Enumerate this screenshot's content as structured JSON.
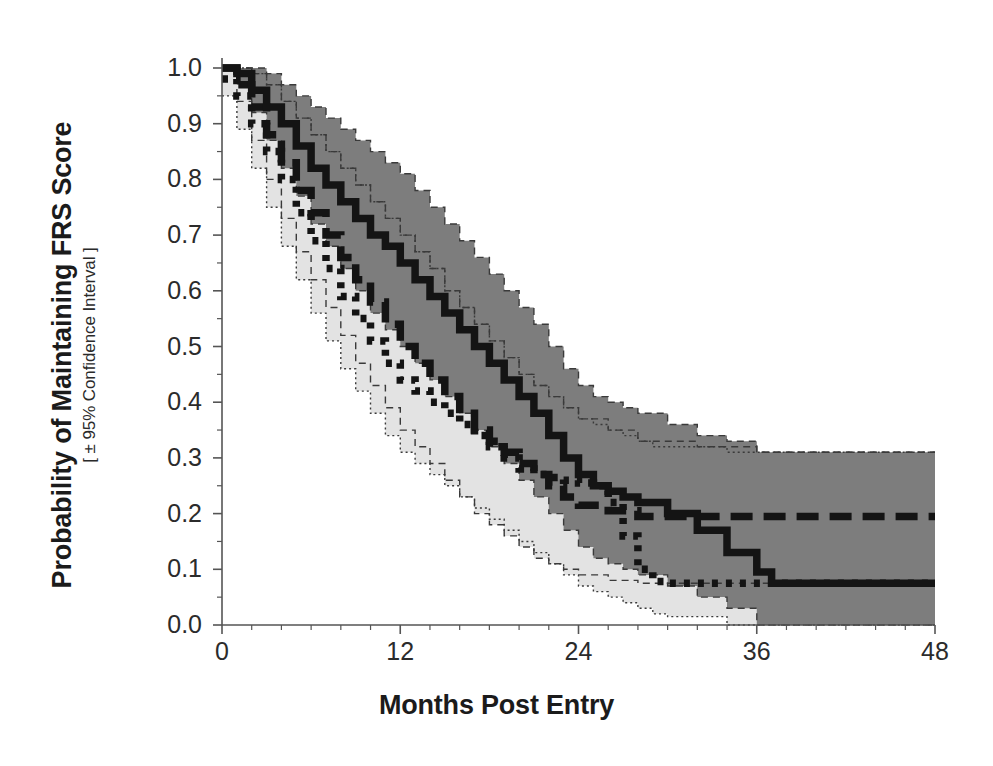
{
  "chart_data": {
    "type": "line",
    "title": "",
    "xlabel": "Months Post Entry",
    "ylabel": "Probability of Maintaining FRS Score",
    "ylabel_sub": "[ ± 95% Confidence Interval ]",
    "xlim": [
      0,
      48
    ],
    "ylim": [
      0.0,
      1.0
    ],
    "grid": false,
    "legend": "none",
    "xticks": [
      "0",
      "12",
      "24",
      "36",
      "48"
    ],
    "xtick_values": [
      0,
      12,
      24,
      36,
      48
    ],
    "yticks": [
      "0.0",
      "0.1",
      "0.2",
      "0.3",
      "0.4",
      "0.5",
      "0.6",
      "0.7",
      "0.8",
      "0.9",
      "1.0"
    ],
    "ytick_values": [
      0.0,
      0.1,
      0.2,
      0.3,
      0.4,
      0.5,
      0.6,
      0.7,
      0.8,
      0.9,
      1.0
    ],
    "x_minor_ticks_per_major": 6,
    "y_minor_ticks_per_major": 2,
    "colors": {
      "curve": "#141414",
      "band_dark": "#7d7d7d",
      "band_light": "#e3e3e3",
      "axis": "#555555",
      "background": "#ffffff"
    },
    "series": [
      {
        "name": "solid-curve",
        "style": "solid",
        "x": [
          0,
          1,
          2,
          3,
          4,
          5,
          6,
          7,
          8,
          9,
          10,
          11,
          12,
          13,
          14,
          15,
          16,
          17,
          18,
          19,
          20,
          21,
          22,
          23,
          24,
          25,
          26,
          27,
          28,
          30,
          32,
          34,
          36,
          37,
          40,
          44,
          48
        ],
        "values": [
          1.0,
          0.99,
          0.96,
          0.93,
          0.9,
          0.86,
          0.82,
          0.79,
          0.76,
          0.73,
          0.7,
          0.68,
          0.65,
          0.62,
          0.59,
          0.56,
          0.53,
          0.5,
          0.47,
          0.44,
          0.41,
          0.38,
          0.34,
          0.3,
          0.27,
          0.25,
          0.24,
          0.23,
          0.22,
          0.2,
          0.17,
          0.13,
          0.095,
          0.075,
          0.075,
          0.075,
          0.075
        ],
        "ci_upper": [
          1.0,
          1.0,
          1.0,
          0.99,
          0.97,
          0.95,
          0.93,
          0.91,
          0.89,
          0.87,
          0.85,
          0.83,
          0.81,
          0.78,
          0.75,
          0.72,
          0.69,
          0.66,
          0.63,
          0.6,
          0.57,
          0.54,
          0.5,
          0.46,
          0.43,
          0.41,
          0.4,
          0.39,
          0.38,
          0.36,
          0.34,
          0.33,
          0.31,
          0.31,
          0.31,
          0.31,
          0.31
        ],
        "ci_lower": [
          1.0,
          0.97,
          0.92,
          0.87,
          0.82,
          0.77,
          0.72,
          0.68,
          0.64,
          0.6,
          0.56,
          0.53,
          0.5,
          0.47,
          0.44,
          0.41,
          0.38,
          0.35,
          0.32,
          0.29,
          0.26,
          0.23,
          0.2,
          0.17,
          0.14,
          0.12,
          0.11,
          0.1,
          0.09,
          0.07,
          0.05,
          0.03,
          0.0,
          0.0,
          0.0,
          0.0,
          0.0
        ]
      },
      {
        "name": "dashed-curve",
        "style": "dashed",
        "x": [
          0,
          1,
          2,
          3,
          4,
          5,
          6,
          7,
          8,
          9,
          10,
          11,
          12,
          13,
          14,
          15,
          16,
          17,
          18,
          19,
          20,
          21,
          22,
          23,
          24,
          26,
          28,
          32,
          36,
          40,
          44,
          48
        ],
        "values": [
          1.0,
          0.97,
          0.93,
          0.88,
          0.83,
          0.78,
          0.74,
          0.7,
          0.66,
          0.62,
          0.58,
          0.54,
          0.5,
          0.47,
          0.44,
          0.41,
          0.38,
          0.35,
          0.33,
          0.31,
          0.29,
          0.27,
          0.25,
          0.23,
          0.215,
          0.205,
          0.195,
          0.195,
          0.195,
          0.195,
          0.195,
          0.195
        ],
        "ci_upper": [
          1.0,
          1.0,
          0.99,
          0.97,
          0.94,
          0.91,
          0.88,
          0.85,
          0.82,
          0.79,
          0.76,
          0.73,
          0.7,
          0.67,
          0.64,
          0.6,
          0.57,
          0.54,
          0.51,
          0.48,
          0.45,
          0.43,
          0.41,
          0.39,
          0.37,
          0.35,
          0.33,
          0.32,
          0.31,
          0.31,
          0.31,
          0.31
        ],
        "ci_lower": [
          1.0,
          0.94,
          0.87,
          0.8,
          0.73,
          0.67,
          0.62,
          0.57,
          0.52,
          0.47,
          0.43,
          0.39,
          0.35,
          0.32,
          0.29,
          0.26,
          0.23,
          0.2,
          0.18,
          0.16,
          0.14,
          0.12,
          0.11,
          0.1,
          0.09,
          0.08,
          0.075,
          0.075,
          0.075,
          0.075,
          0.075,
          0.075
        ]
      },
      {
        "name": "dotted-curve",
        "style": "dotted",
        "x": [
          0,
          1,
          2,
          3,
          4,
          5,
          6,
          7,
          8,
          9,
          10,
          11,
          12,
          13,
          14,
          15,
          16,
          17,
          18,
          19,
          20,
          21,
          22,
          23,
          24,
          25,
          26,
          27,
          28,
          29,
          30,
          34,
          38,
          42,
          48
        ],
        "values": [
          0.98,
          0.95,
          0.9,
          0.85,
          0.8,
          0.74,
          0.69,
          0.64,
          0.59,
          0.55,
          0.51,
          0.47,
          0.44,
          0.42,
          0.4,
          0.38,
          0.36,
          0.34,
          0.32,
          0.3,
          0.28,
          0.27,
          0.265,
          0.26,
          0.255,
          0.25,
          0.22,
          0.16,
          0.1,
          0.078,
          0.075,
          0.075,
          0.075,
          0.075,
          0.075
        ],
        "ci_upper": [
          1.0,
          1.0,
          0.99,
          0.97,
          0.94,
          0.91,
          0.88,
          0.85,
          0.82,
          0.79,
          0.76,
          0.73,
          0.7,
          0.67,
          0.64,
          0.6,
          0.57,
          0.54,
          0.51,
          0.48,
          0.45,
          0.43,
          0.41,
          0.39,
          0.37,
          0.36,
          0.35,
          0.34,
          0.33,
          0.32,
          0.32,
          0.31,
          0.31,
          0.31,
          0.31
        ],
        "ci_lower": [
          0.95,
          0.89,
          0.82,
          0.75,
          0.68,
          0.62,
          0.56,
          0.51,
          0.46,
          0.42,
          0.38,
          0.34,
          0.31,
          0.29,
          0.27,
          0.25,
          0.23,
          0.21,
          0.19,
          0.17,
          0.15,
          0.13,
          0.11,
          0.09,
          0.07,
          0.06,
          0.05,
          0.04,
          0.03,
          0.02,
          0.015,
          0.0,
          0.0,
          0.0,
          0.0
        ]
      }
    ]
  },
  "caption": {
    "text": ""
  }
}
